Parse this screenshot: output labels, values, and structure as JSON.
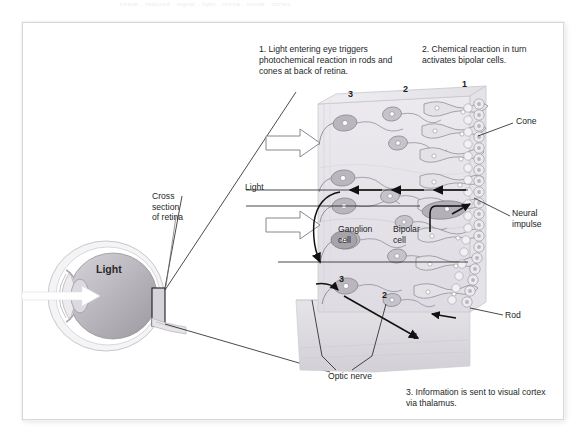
{
  "document": {
    "scan_top_partial_text": "tissue . reduced  .  signal    .   light  .  retina  .  visual   .   cortex",
    "frame_color": "#d9d9dc",
    "background": "#ffffff"
  },
  "captions": {
    "step1": "1. Light entering eye triggers photochemical reaction in rods and cones at back of retina.",
    "step2": "2. Chemical reaction in turn activates bipolar cells.",
    "step3": "3. Information is sent to visual cortex via thalamus."
  },
  "labels": {
    "cross_section": "Cross\nsection\nof retina",
    "light_retina": "Light",
    "light_eye": "Light",
    "ganglion_cell": "Ganglion\ncell",
    "bipolar_cell": "Bipolar\ncell",
    "cone": "Cone",
    "neural_impulse": "Neural\nimpulse",
    "rod": "Rod",
    "optic_nerve": "Optic nerve"
  },
  "layer_numbers": {
    "top": [
      "3",
      "2",
      "1"
    ],
    "bottom": [
      "3",
      "2",
      "1"
    ]
  },
  "colors": {
    "ink": "#221f1f",
    "retina_block": "#e8e6ea",
    "cell_fill": "#b9b6bd",
    "eye_sclera": "#f0eef1",
    "eye_vitreous": "#bab7be",
    "arrow_outline": "#6b6b70",
    "neural_arrow": "#111111"
  }
}
